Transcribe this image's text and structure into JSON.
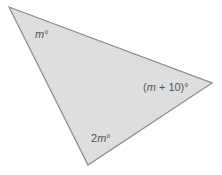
{
  "diagram": {
    "type": "triangle",
    "fill": "#dedede",
    "stroke": "#8c8c8c",
    "vertices": [
      [
        9,
        7
      ],
      [
        212,
        83
      ],
      [
        88,
        165
      ]
    ],
    "angles": {
      "top_left": "m°",
      "right": "(m + 10)°",
      "bottom": "2m°"
    }
  }
}
